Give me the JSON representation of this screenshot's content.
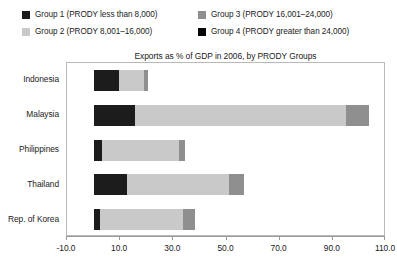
{
  "legend": {
    "columns": [
      {
        "items": [
          {
            "label": "Group 1 (PRODY less than 8,000)",
            "color": "#1c1c1c",
            "swatch_icon": "legend-swatch-icon"
          },
          {
            "label": "Group 2 (PRODY 8,001–16,000)",
            "color": "#c9c9c9",
            "swatch_icon": "legend-swatch-icon"
          }
        ]
      },
      {
        "items": [
          {
            "label": "Group 3 (PRODY 16,001–24,000)",
            "color": "#8f8f8f",
            "swatch_icon": "legend-swatch-icon"
          },
          {
            "label": "Group 4 (PRODY greater than 24,000)",
            "color": "#050505",
            "swatch_icon": "legend-swatch-icon"
          }
        ]
      }
    ]
  },
  "chart_data": {
    "type": "bar",
    "orientation": "horizontal",
    "stacked": true,
    "title": "Exports as % of GDP in 2006, by PRODY Groups",
    "xlabel": "",
    "ylabel": "",
    "xlim": [
      -10.0,
      110.0
    ],
    "ylim": null,
    "grid": false,
    "legend_position": "top",
    "xticks": [
      "-10.0",
      "10.0",
      "30.0",
      "50.0",
      "70.0",
      "90.0",
      "110.0"
    ],
    "xtick_values": [
      -10.0,
      10.0,
      30.0,
      50.0,
      70.0,
      90.0,
      110.0
    ],
    "categories": [
      "Indonesia",
      "Malaysia",
      "Philippines",
      "Thailand",
      "Rep. of Korea"
    ],
    "series": [
      {
        "name": "Group 1 (PRODY less than 8,000)",
        "color": "#1c1c1c",
        "values": [
          9.5,
          15.5,
          3.0,
          12.5,
          2.5
        ]
      },
      {
        "name": "Group 2 (PRODY 8,001–16,000)",
        "color": "#c9c9c9",
        "values": [
          9.5,
          79.5,
          29.0,
          38.5,
          31.0
        ]
      },
      {
        "name": "Group 3 (PRODY 16,001–24,000)",
        "color": "#8f8f8f",
        "values": [
          1.5,
          8.5,
          2.5,
          5.5,
          4.5
        ]
      },
      {
        "name": "Group 4 (PRODY greater than 24,000)",
        "color": "#050505",
        "values": [
          0.0,
          0.0,
          0.0,
          0.0,
          0.0
        ]
      }
    ],
    "totals": [
      20.5,
      103.5,
      34.5,
      56.5,
      38.0
    ]
  }
}
